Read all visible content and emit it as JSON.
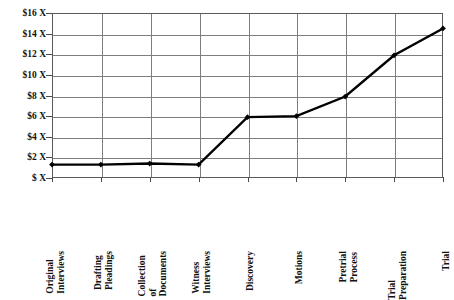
{
  "chart_data": {
    "type": "line",
    "title": "",
    "xlabel": "",
    "ylabel": "",
    "categories": [
      "Original Interviews",
      "Drafting Pleadings",
      "Collection of Documents",
      "Witness Interviews",
      "Discovery",
      "Motions",
      "Pretrial Process",
      "Trial Preparation",
      "Trial"
    ],
    "category_label_lines": [
      [
        "Original",
        "Interviews"
      ],
      [
        "Drafting",
        "Pleadings"
      ],
      [
        "Collection",
        "of",
        "Documents"
      ],
      [
        "Witness",
        "Interviews"
      ],
      [
        "Discovery"
      ],
      [
        "Motions"
      ],
      [
        "Pretrial",
        "Process"
      ],
      [
        "Trial",
        "Preparation"
      ],
      [
        "Trial"
      ]
    ],
    "values": [
      1.3,
      1.3,
      1.4,
      1.3,
      5.9,
      6.0,
      7.9,
      11.9,
      14.5
    ],
    "ylim": [
      0,
      16
    ],
    "ytick_values": [
      16,
      14,
      12,
      10,
      8,
      6,
      4,
      2,
      0
    ],
    "ytick_labels": [
      "$16 X",
      "$14 X",
      "$12 X",
      "$10 X",
      "$8 X",
      "$6 X",
      "$4 X",
      "$2 X",
      "$ X"
    ],
    "grid": true,
    "legend": "none",
    "series_color": "#000000",
    "grid_color": "#7d7d7d",
    "axis_color": "#4a4a4a",
    "background_color": "#ffffff",
    "marker": "diamond"
  }
}
